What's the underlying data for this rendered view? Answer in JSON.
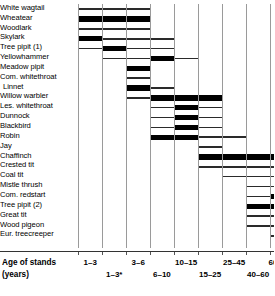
{
  "chart_data": {
    "type": "bar",
    "title": "",
    "subtitle": "",
    "xlabel": "Age of stands (years)",
    "ylabel": "",
    "grid": true,
    "legend": "none",
    "orientation": "horizontal",
    "axis_title_line1": "Age of stands",
    "axis_title_line2": "(years)",
    "categories": [
      "1–3",
      "1–3*",
      "3–6",
      "6–10",
      "10–15",
      "15–25",
      "25–45",
      "40–60",
      "60–100"
    ],
    "tick_labels_top": [
      "1–3",
      "3–6",
      "10–15",
      "25–45",
      "60–100"
    ],
    "tick_labels_bottom": [
      "1–3*",
      "6–10",
      "15–25",
      "40–60"
    ],
    "series": [
      {
        "name": "White wagtail",
        "values": [
          1,
          1,
          1,
          0,
          0,
          0,
          0,
          0,
          0
        ],
        "peaks": []
      },
      {
        "name": "Wheatear",
        "values": [
          2,
          2,
          2,
          0,
          0,
          0,
          0,
          0,
          0
        ],
        "peaks": [
          0,
          1,
          2
        ]
      },
      {
        "name": "Woodlark",
        "values": [
          1,
          1,
          1,
          0,
          0,
          0,
          0,
          0,
          0
        ],
        "peaks": []
      },
      {
        "name": "Skylark",
        "values": [
          2,
          1,
          1,
          1,
          0,
          0,
          0,
          0,
          0
        ],
        "peaks": [
          0
        ]
      },
      {
        "name": "Tree pipit (1)",
        "values": [
          1,
          2,
          1,
          1,
          0,
          0,
          0,
          0,
          0
        ],
        "peaks": [
          1
        ]
      },
      {
        "name": "Yellowhammer",
        "values": [
          0,
          1,
          1,
          2,
          1,
          0,
          0,
          0,
          0
        ],
        "peaks": [
          3
        ]
      },
      {
        "name": "Meadow pipit",
        "values": [
          0,
          0,
          2,
          0,
          0,
          0,
          0,
          0,
          0
        ],
        "peaks": [
          2
        ]
      },
      {
        "name": "Com. whitethroat",
        "values": [
          0,
          0,
          1,
          0,
          0,
          0,
          0,
          0,
          0
        ],
        "peaks": []
      },
      {
        "name": "Linnet",
        "values": [
          0,
          0,
          2,
          1,
          0,
          0,
          0,
          0,
          0
        ],
        "peaks": [
          2
        ]
      },
      {
        "name": "Willow warbler",
        "values": [
          0,
          0,
          1,
          2,
          2,
          2,
          0,
          0,
          0
        ],
        "peaks": [
          3,
          4,
          5
        ]
      },
      {
        "name": "Les. whitethroat",
        "values": [
          0,
          0,
          0,
          1,
          2,
          1,
          0,
          0,
          0
        ],
        "peaks": [
          4
        ]
      },
      {
        "name": "Dunnock",
        "values": [
          0,
          0,
          0,
          1,
          2,
          1,
          0,
          0,
          0
        ],
        "peaks": [
          4
        ]
      },
      {
        "name": "Blackbird",
        "values": [
          0,
          0,
          0,
          1,
          2,
          1,
          0,
          0,
          0
        ],
        "peaks": [
          4
        ]
      },
      {
        "name": "Robin",
        "values": [
          0,
          0,
          0,
          2,
          2,
          1,
          1,
          0,
          0
        ],
        "peaks": [
          3,
          4
        ]
      },
      {
        "name": "Jay",
        "values": [
          0,
          0,
          0,
          0,
          0,
          1,
          0,
          0,
          0
        ],
        "peaks": []
      },
      {
        "name": "Chaffinch",
        "values": [
          0,
          0,
          0,
          0,
          0,
          2,
          2,
          2,
          2
        ],
        "peaks": [
          5,
          6,
          7,
          8
        ]
      },
      {
        "name": "Crested tit",
        "values": [
          0,
          0,
          0,
          0,
          0,
          1,
          1,
          1,
          1
        ],
        "peaks": [
          6,
          7,
          8
        ]
      },
      {
        "name": "Coal tit",
        "values": [
          0,
          0,
          0,
          0,
          0,
          0,
          1,
          1,
          1
        ],
        "peaks": [
          7,
          8
        ]
      },
      {
        "name": "Mistle thrush",
        "values": [
          0,
          0,
          0,
          0,
          0,
          0,
          0,
          1,
          1
        ],
        "peaks": [
          7,
          8
        ]
      },
      {
        "name": "Com. redstart",
        "values": [
          0,
          0,
          0,
          0,
          0,
          0,
          0,
          1,
          2
        ],
        "peaks": [
          8
        ]
      },
      {
        "name": "Tree pipit (2)",
        "values": [
          0,
          0,
          0,
          0,
          0,
          0,
          0,
          2,
          2
        ],
        "peaks": [
          7,
          8
        ]
      },
      {
        "name": "Great tit",
        "values": [
          0,
          0,
          0,
          0,
          0,
          0,
          0,
          1,
          1
        ],
        "peaks": []
      },
      {
        "name": "Wood pigeon",
        "values": [
          0,
          0,
          0,
          0,
          0,
          0,
          0,
          1,
          1
        ],
        "peaks": []
      },
      {
        "name": "Eur. treecreeper",
        "values": [
          0,
          0,
          0,
          0,
          0,
          0,
          0,
          0,
          1
        ],
        "peaks": []
      }
    ]
  },
  "species": [
    {
      "label": "White wagtail",
      "indent": false
    },
    {
      "label": "Wheatear",
      "indent": false
    },
    {
      "label": "Woodlark",
      "indent": false
    },
    {
      "label": "Skylark",
      "indent": false
    },
    {
      "label": "Tree pipit (1)",
      "indent": false
    },
    {
      "label": "Yellowhammer",
      "indent": false
    },
    {
      "label": "Meadow pipit",
      "indent": false
    },
    {
      "label": "Com. whitethroat",
      "indent": false
    },
    {
      "label": "Linnet",
      "indent": true
    },
    {
      "label": "Willow warbler",
      "indent": false
    },
    {
      "label": "Les. whitethroat",
      "indent": false
    },
    {
      "label": "Dunnock",
      "indent": false
    },
    {
      "label": "Blackbird",
      "indent": false
    },
    {
      "label": "Robin",
      "indent": false
    },
    {
      "label": "Jay",
      "indent": false
    },
    {
      "label": "Chaffinch",
      "indent": false
    },
    {
      "label": "Crested tit",
      "indent": false
    },
    {
      "label": "Coal tit",
      "indent": false
    },
    {
      "label": "Mistle thrush",
      "indent": false
    },
    {
      "label": "Com. redstart",
      "indent": false
    },
    {
      "label": "Tree pipit (2)",
      "indent": false
    },
    {
      "label": "Great tit",
      "indent": false
    },
    {
      "label": "Wood pigeon",
      "indent": false
    },
    {
      "label": "Eur. treecreeper",
      "indent": false
    }
  ],
  "axis": {
    "title_line1": "Age of stands",
    "title_line2": "(years)",
    "labels_top": [
      "1–3",
      "3–6",
      "10–15",
      "25–45",
      "60–100"
    ],
    "labels_bottom": [
      "1–3*",
      "6–10",
      "15–25",
      "40–60"
    ]
  },
  "colors": {
    "bar": "#000000",
    "thin_bar": "#2a2a2a",
    "gridline": "#9a9a9a",
    "axis": "#333333",
    "background": "#ffffff",
    "text": "#000000"
  }
}
